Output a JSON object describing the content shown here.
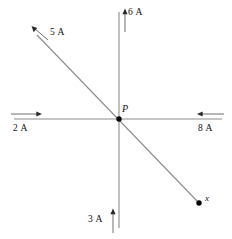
{
  "figure": {
    "width": 232,
    "height": 239,
    "background_color": "#ffffff",
    "line_color": "#8c8c8c",
    "text_color": "#101010",
    "dot_color": "#000000"
  },
  "junction": {
    "label": "P",
    "x": 119,
    "y": 119,
    "dot_radius": 2.6
  },
  "branches": [
    {
      "id": "top",
      "label": "6 A",
      "current_amps": 6,
      "direction": "up",
      "orientation": "vertical",
      "arrow_position": "top-of-axis"
    },
    {
      "id": "upper-left-diagonal",
      "label": "5 A",
      "current_amps": 5,
      "direction": "up-left",
      "orientation": "diagonal",
      "arrow_position": "upper-left-end"
    },
    {
      "id": "left",
      "label": "2 A",
      "current_amps": 2,
      "direction": "right",
      "orientation": "horizontal",
      "arrow_position": "left-end"
    },
    {
      "id": "right",
      "label": "8 A",
      "current_amps": 8,
      "direction": "left",
      "orientation": "horizontal",
      "arrow_position": "right-end"
    },
    {
      "id": "bottom",
      "label": "3 A",
      "current_amps": 3,
      "direction": "up",
      "orientation": "vertical",
      "arrow_position": "bottom-of-axis"
    }
  ],
  "unknown": {
    "label": "x",
    "endpoint_x": 199,
    "endpoint_y": 203
  }
}
